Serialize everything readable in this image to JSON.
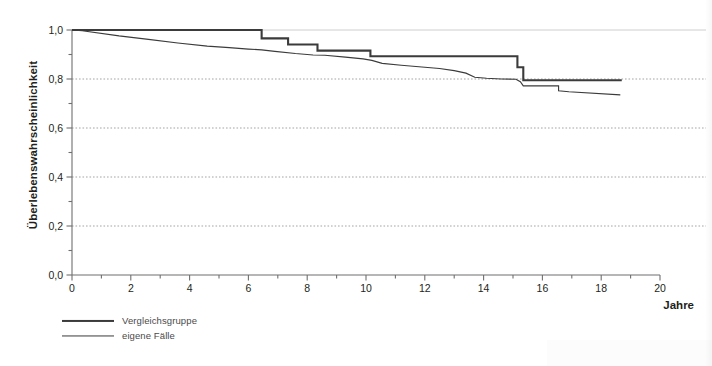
{
  "chart_data": {
    "type": "line",
    "title": "",
    "subtitle": "",
    "xlabel": "Jahre",
    "ylabel": "Überlebenswahrscheinlichkeit",
    "xlim": [
      0,
      20
    ],
    "ylim": [
      0,
      1
    ],
    "grid": "horizontal dotted gridlines at every 0.2",
    "legend_position": "below-left",
    "x_major_ticks": [
      0,
      2,
      4,
      6,
      8,
      10,
      12,
      14,
      16,
      18,
      20
    ],
    "x_major_tick_labels": [
      "0",
      "2",
      "4",
      "6",
      "8",
      "10",
      "12",
      "14",
      "16",
      "18",
      "20"
    ],
    "x_minor_tick_step": 1,
    "y_major_ticks": [
      0.0,
      0.2,
      0.4,
      0.6,
      0.8,
      1.0
    ],
    "y_major_tick_labels": [
      "0,0",
      "0,2",
      "0,4",
      "0,6",
      "0,8",
      "1,0"
    ],
    "y_minor_tick_step": 0.1,
    "series": [
      {
        "name": "Vergleichsgruppe",
        "style": "step",
        "line_width": 2.1,
        "color": "#3b3b3b",
        "points": [
          [
            0.0,
            1.0
          ],
          [
            6.45,
            1.0
          ],
          [
            6.45,
            0.966
          ],
          [
            7.35,
            0.966
          ],
          [
            7.35,
            0.941
          ],
          [
            8.35,
            0.941
          ],
          [
            8.35,
            0.916
          ],
          [
            10.15,
            0.916
          ],
          [
            10.15,
            0.893
          ],
          [
            15.15,
            0.893
          ],
          [
            15.15,
            0.848
          ],
          [
            15.35,
            0.848
          ],
          [
            15.35,
            0.795
          ],
          [
            18.7,
            0.795
          ]
        ]
      },
      {
        "name": "eigene Fälle",
        "style": "step",
        "line_width": 1.15,
        "color": "#3b3b3b",
        "points": [
          [
            0.0,
            1.0
          ],
          [
            0.35,
            0.997
          ],
          [
            1.6,
            0.976
          ],
          [
            2.6,
            0.962
          ],
          [
            3.6,
            0.947
          ],
          [
            4.6,
            0.934
          ],
          [
            5.35,
            0.928
          ],
          [
            6.0,
            0.922
          ],
          [
            6.45,
            0.919
          ],
          [
            6.9,
            0.913
          ],
          [
            7.6,
            0.904
          ],
          [
            8.2,
            0.898
          ],
          [
            8.6,
            0.897
          ],
          [
            9.3,
            0.889
          ],
          [
            9.9,
            0.882
          ],
          [
            10.2,
            0.876
          ],
          [
            10.55,
            0.864
          ],
          [
            11.2,
            0.856
          ],
          [
            11.9,
            0.849
          ],
          [
            12.5,
            0.843
          ],
          [
            13.0,
            0.834
          ],
          [
            13.4,
            0.824
          ],
          [
            13.7,
            0.807
          ],
          [
            14.1,
            0.803
          ],
          [
            14.6,
            0.8
          ],
          [
            15.1,
            0.799
          ],
          [
            15.25,
            0.789
          ],
          [
            15.35,
            0.772
          ],
          [
            16.55,
            0.772
          ],
          [
            16.55,
            0.752
          ],
          [
            16.9,
            0.748
          ],
          [
            18.65,
            0.735
          ]
        ]
      }
    ],
    "annotations": []
  },
  "legend": {
    "items": [
      {
        "label": "Vergleichsgruppe",
        "weight": "thick"
      },
      {
        "label": "eigene Fälle",
        "weight": "thin"
      }
    ]
  },
  "colors": {
    "line": "#3b3b3b",
    "axis": "#6f6f6f",
    "grid": "#9a9a9a",
    "text": "#231f20",
    "background": "#ffffff"
  }
}
